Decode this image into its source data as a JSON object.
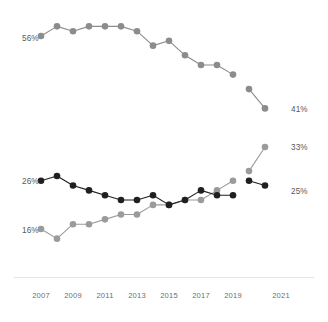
{
  "chart_data": {
    "type": "line",
    "title": "",
    "subtitle": "",
    "xlabel": "",
    "ylabel": "",
    "grid": false,
    "legend_position": "none",
    "xlim": [
      2007,
      2022
    ],
    "ylim": [
      10,
      60
    ],
    "x": [
      2007,
      2008,
      2009,
      2010,
      2011,
      2012,
      2013,
      2014,
      2015,
      2016,
      2017,
      2018,
      2019,
      2020,
      2021
    ],
    "tick_labels_x": [
      "2007",
      "2009",
      "2011",
      "2013",
      "2015",
      "2017",
      "2019",
      "2021"
    ],
    "tick_values_x": [
      2007,
      2009,
      2011,
      2013,
      2015,
      2017,
      2019,
      2021
    ],
    "series": [
      {
        "name": "top-gray-series",
        "color": "#8c8c8c",
        "values": [
          56,
          58,
          57,
          58,
          58,
          58,
          57,
          54,
          55,
          52,
          50,
          50,
          48,
          45,
          41
        ],
        "break_after_index": 12,
        "start_label": "56%",
        "end_label": "41%"
      },
      {
        "name": "dark-series",
        "color": "#231f20",
        "values": [
          26,
          27,
          25,
          24,
          23,
          22,
          22,
          23,
          21,
          22,
          24,
          23,
          23,
          26,
          25
        ],
        "break_after_index": 12,
        "start_label": "26%",
        "end_label": "25%"
      },
      {
        "name": "bottom-gray-series",
        "color": "#9b9b9b",
        "values": [
          16,
          14,
          17,
          17,
          18,
          19,
          19,
          21,
          21,
          22,
          22,
          24,
          26,
          28,
          33
        ],
        "break_after_index": 12,
        "start_label": "16%",
        "end_label": "33%"
      }
    ],
    "annotations": [
      {
        "name": "label-56",
        "text": "56%",
        "x_px": 22,
        "y_px": 41
      },
      {
        "name": "label-41",
        "text": "41%",
        "x_px": 291,
        "y_px": 112
      },
      {
        "name": "label-33",
        "text": "33%",
        "x_px": 291,
        "y_px": 150
      },
      {
        "name": "label-26",
        "text": "26%",
        "x_px": 22,
        "y_px": 184
      },
      {
        "name": "label-25",
        "text": "25%",
        "x_px": 291,
        "y_px": 194
      },
      {
        "name": "label-16",
        "text": "16%",
        "x_px": 22,
        "y_px": 233
      }
    ]
  },
  "colors": {
    "top_series": "#8c8c8c",
    "dark_series": "#231f20",
    "bottom_series": "#9b9b9b",
    "axis": "#e3e4e6",
    "tick_text": "#6d6e71",
    "label_text": "#58595b",
    "background": "#ffffff"
  },
  "axis": {
    "x_ticks": [
      {
        "label": "2007",
        "x_px": 41
      },
      {
        "label": "2009",
        "x_px": 73
      },
      {
        "label": "2011",
        "x_px": 105
      },
      {
        "label": "2013",
        "x_px": 137
      },
      {
        "label": "2015",
        "x_px": 169
      },
      {
        "label": "2017",
        "x_px": 201
      },
      {
        "label": "2019",
        "x_px": 233
      },
      {
        "label": "2021",
        "x_px": 281
      }
    ]
  }
}
